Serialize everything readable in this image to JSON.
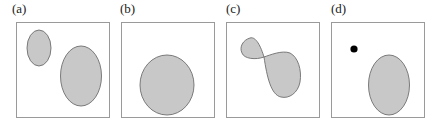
{
  "panels": [
    {
      "label": "(a)",
      "description": "Two disjoint shaded ellipses inside a square"
    },
    {
      "label": "(b)",
      "description": "Single shaded ellipse inside a square"
    },
    {
      "label": "(c)",
      "description": "Shaded region made of two lobes joined at a single pinch point"
    },
    {
      "label": "(d)",
      "description": "Isolated black point next to a shaded ellipse"
    }
  ],
  "colors": {
    "frame": "#9a9a9a",
    "region_fill": "#c8c8c8",
    "region_stroke": "#6e6e6e",
    "point": "#000000"
  }
}
